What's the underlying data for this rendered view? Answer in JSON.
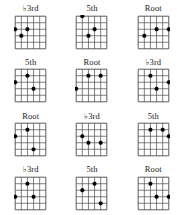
{
  "page": {
    "background_color": "#ffffff",
    "line_color": "#4a4a4a",
    "dot_color": "#000000",
    "label_color": "#1a1a1a",
    "columns": 3,
    "rows": 4
  },
  "fretboard_spec": {
    "strings": 6,
    "frets": 6,
    "note": "Dot coordinates are given as [string_index, fret_index]; string 0 is the leftmost vertical line, fret 0 is the topmost horizontal line. Dots lie on line intersections."
  },
  "diagrams": [
    {
      "index": 0,
      "row": 1,
      "column": 1,
      "label": "♭3rd",
      "label_plain": "b3rd",
      "interval": "flat-third",
      "dots": [
        {
          "string": 0,
          "fret": 2
        },
        {
          "string": 2,
          "fret": 2
        },
        {
          "string": 1,
          "fret": 3
        }
      ]
    },
    {
      "index": 1,
      "row": 1,
      "column": 2,
      "label": "5th",
      "label_plain": "5th",
      "interval": "fifth",
      "dots": [
        {
          "string": 1,
          "fret": 0
        },
        {
          "string": 3,
          "fret": 2
        },
        {
          "string": 2,
          "fret": 3
        }
      ]
    },
    {
      "index": 2,
      "row": 1,
      "column": 3,
      "label": "Root",
      "label_plain": "Root",
      "interval": "root",
      "dots": [
        {
          "string": 3,
          "fret": 2
        },
        {
          "string": 5,
          "fret": 2
        },
        {
          "string": 1,
          "fret": 3
        }
      ]
    },
    {
      "index": 3,
      "row": 2,
      "column": 1,
      "label": "5th",
      "label_plain": "5th",
      "interval": "fifth",
      "dots": [
        {
          "string": 0,
          "fret": 2
        },
        {
          "string": 2,
          "fret": 1
        },
        {
          "string": 3,
          "fret": 3
        }
      ]
    },
    {
      "index": 4,
      "row": 2,
      "column": 2,
      "label": "Root",
      "label_plain": "Root",
      "interval": "root",
      "dots": [
        {
          "string": 2,
          "fret": 1
        },
        {
          "string": 4,
          "fret": 1
        },
        {
          "string": 0,
          "fret": 3
        }
      ]
    },
    {
      "index": 5,
      "row": 2,
      "column": 3,
      "label": "♭3rd",
      "label_plain": "b3rd",
      "interval": "flat-third",
      "dots": [
        {
          "string": 2,
          "fret": 1
        },
        {
          "string": 5,
          "fret": 2
        },
        {
          "string": 3,
          "fret": 3
        }
      ]
    },
    {
      "index": 6,
      "row": 3,
      "column": 1,
      "label": "Root",
      "label_plain": "Root",
      "interval": "root",
      "dots": [
        {
          "string": 2,
          "fret": 1
        },
        {
          "string": 0,
          "fret": 2
        },
        {
          "string": 3,
          "fret": 4
        }
      ]
    },
    {
      "index": 7,
      "row": 3,
      "column": 2,
      "label": "♭3rd",
      "label_plain": "b3rd",
      "interval": "flat-third",
      "dots": [
        {
          "string": 1,
          "fret": 2
        },
        {
          "string": 2,
          "fret": 3
        },
        {
          "string": 4,
          "fret": 3
        }
      ]
    },
    {
      "index": 8,
      "row": 3,
      "column": 3,
      "label": "5th",
      "label_plain": "5th",
      "interval": "fifth",
      "dots": [
        {
          "string": 2,
          "fret": 1
        },
        {
          "string": 4,
          "fret": 1
        },
        {
          "string": 5,
          "fret": 2
        }
      ]
    },
    {
      "index": 9,
      "row": 4,
      "column": 1,
      "label": "♭3rd",
      "label_plain": "b3rd",
      "interval": "flat-third",
      "dots": [
        {
          "string": 2,
          "fret": 1
        },
        {
          "string": 0,
          "fret": 3
        },
        {
          "string": 3,
          "fret": 3
        }
      ]
    },
    {
      "index": 10,
      "row": 4,
      "column": 2,
      "label": "5th",
      "label_plain": "5th",
      "interval": "fifth",
      "dots": [
        {
          "string": 1,
          "fret": 2
        },
        {
          "string": 3,
          "fret": 1
        },
        {
          "string": 4,
          "fret": 4
        }
      ]
    },
    {
      "index": 11,
      "row": 4,
      "column": 3,
      "label": "Root",
      "label_plain": "Root",
      "interval": "root",
      "dots": [
        {
          "string": 2,
          "fret": 1
        },
        {
          "string": 3,
          "fret": 3
        },
        {
          "string": 5,
          "fret": 3
        }
      ]
    }
  ]
}
